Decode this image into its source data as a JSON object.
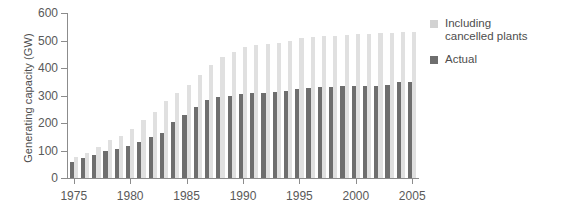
{
  "chart_data": {
    "type": "bar",
    "title": "",
    "subtitle": "",
    "xlabel": "",
    "ylabel": "Generating capacity (GW)",
    "ylim": [
      0,
      600
    ],
    "yticks": [
      0,
      100,
      200,
      300,
      400,
      500,
      600
    ],
    "ytick_labels": [
      "0",
      "100",
      "200",
      "300",
      "400",
      "500",
      "600"
    ],
    "xlim": [
      1974.4,
      2005.6
    ],
    "xticks": [
      1975,
      1980,
      1985,
      1990,
      1995,
      2000,
      2005
    ],
    "xtick_labels": [
      "1975",
      "1980",
      "1985",
      "1990",
      "1995",
      "2000",
      "2005"
    ],
    "grid": false,
    "legend_position": "right",
    "categories": [
      "1975",
      "1976",
      "1977",
      "1978",
      "1979",
      "1980",
      "1981",
      "1982",
      "1983",
      "1984",
      "1985",
      "1986",
      "1987",
      "1988",
      "1989",
      "1990",
      "1991",
      "1992",
      "1993",
      "1994",
      "1995",
      "1996",
      "1997",
      "1998",
      "1999",
      "2000",
      "2001",
      "2002",
      "2003",
      "2004",
      "2005"
    ],
    "series": [
      {
        "name": "Actual",
        "color": "#6e6e6e",
        "values": [
          60,
          72,
          84,
          100,
          104,
          116,
          130,
          150,
          165,
          205,
          230,
          260,
          285,
          295,
          300,
          305,
          308,
          310,
          312,
          318,
          325,
          328,
          330,
          332,
          333,
          334,
          335,
          336,
          340,
          348,
          350
        ]
      },
      {
        "name": "Including cancelled plants",
        "color": "#e0e0e0",
        "values": [
          76,
          92,
          112,
          140,
          152,
          178,
          210,
          240,
          280,
          310,
          340,
          375,
          412,
          440,
          460,
          475,
          482,
          488,
          492,
          500,
          508,
          512,
          516,
          518,
          520,
          522,
          524,
          526,
          528,
          530,
          530
        ]
      }
    ]
  },
  "legend": {
    "items": [
      {
        "label_line1": "Including",
        "label_line2": "cancelled plants",
        "color": "#d2d2d2"
      },
      {
        "label_line1": "Actual",
        "label_line2": "",
        "color": "#6e6e6e"
      }
    ]
  }
}
